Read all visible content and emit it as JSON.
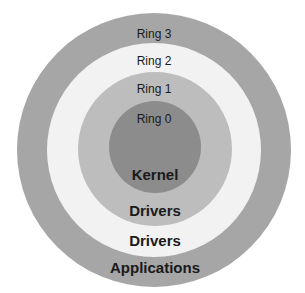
{
  "diagram": {
    "colors": {
      "ring3": "#a6a6a6",
      "ring2": "#f2f2f2",
      "ring1": "#bdbdbd",
      "ring0": "#8c8c8c",
      "text": "#1a1a1a"
    },
    "rings": [
      {
        "name": "Ring 3",
        "role": "Applications"
      },
      {
        "name": "Ring 2",
        "role": "Drivers"
      },
      {
        "name": "Ring 1",
        "role": "Drivers"
      },
      {
        "name": "Ring 0",
        "role": "Kernel"
      }
    ]
  }
}
